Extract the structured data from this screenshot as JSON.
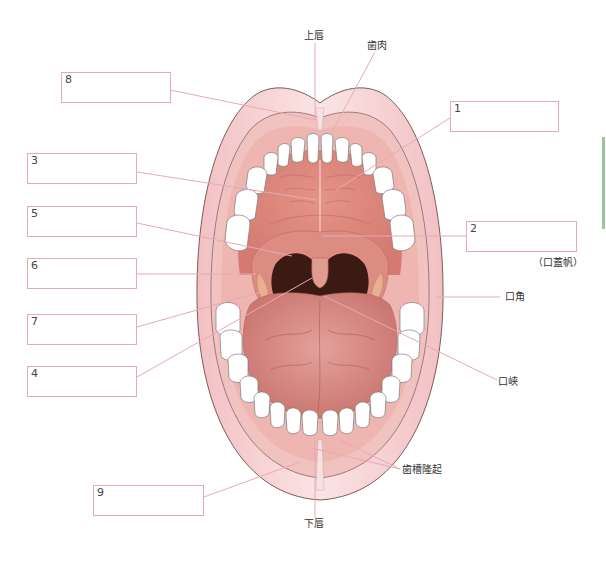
{
  "diagram": {
    "colors": {
      "lip": "#f4cfd2",
      "lip_outline": "#7b5a5d",
      "gum": "#f0b9b6",
      "palate": "#e28b80",
      "throat": "#3b1a14",
      "tongue": "#db8c86",
      "tooth": "#ffffff",
      "leader_line": "#e7a9b8",
      "box_border": "#e7a9b8",
      "side_marker": "#98c79a"
    },
    "blank_boxes": [
      {
        "number": "8",
        "value": ""
      },
      {
        "number": "1",
        "value": ""
      },
      {
        "number": "3",
        "value": ""
      },
      {
        "number": "5",
        "value": ""
      },
      {
        "number": "2",
        "value": ""
      },
      {
        "number": "6",
        "value": ""
      },
      {
        "number": "7",
        "value": ""
      },
      {
        "number": "4",
        "value": ""
      },
      {
        "number": "9",
        "value": ""
      }
    ],
    "labels": {
      "upper_lip": "上唇",
      "gingiva": "歯肉",
      "soft_palate_hint": "（口蓋帆）",
      "mouth_corner": "口角",
      "fauces": "口峡",
      "alveolar_ridge": "歯槽隆起",
      "lower_lip": "下唇"
    }
  }
}
